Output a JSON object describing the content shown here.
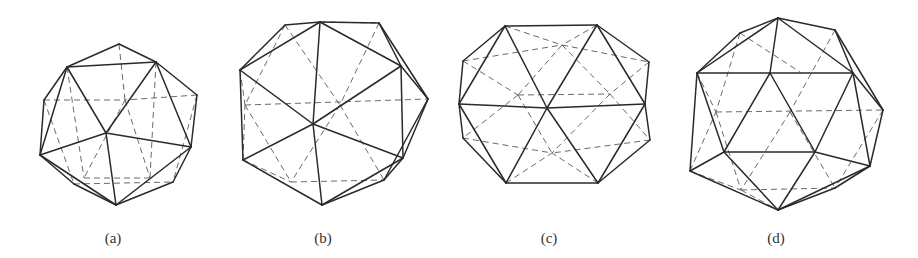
{
  "figure": {
    "colors": {
      "background": "#ffffff",
      "visible_edge": "#2a2a2a",
      "hidden_edge": "#6a6a6a",
      "caption": "#333333"
    },
    "panels": [
      {
        "id": "a",
        "caption": "(a)",
        "caption_x": 113,
        "visible_edges": [
          [
            119,
            44,
            67,
            67
          ],
          [
            119,
            44,
            156,
            62
          ],
          [
            67,
            67,
            156,
            62
          ],
          [
            67,
            67,
            44,
            100
          ],
          [
            156,
            62,
            197,
            95
          ],
          [
            67,
            67,
            106,
            133
          ],
          [
            156,
            62,
            106,
            133
          ],
          [
            44,
            100,
            40,
            155
          ],
          [
            197,
            95,
            191,
            147
          ],
          [
            67,
            67,
            40,
            155
          ],
          [
            156,
            62,
            191,
            147
          ],
          [
            106,
            133,
            40,
            155
          ],
          [
            106,
            133,
            191,
            147
          ],
          [
            106,
            133,
            116,
            205
          ],
          [
            40,
            155,
            74,
            184
          ],
          [
            74,
            184,
            116,
            205
          ],
          [
            40,
            155,
            116,
            205
          ],
          [
            191,
            147,
            173,
            182
          ],
          [
            173,
            182,
            116,
            205
          ],
          [
            191,
            147,
            116,
            205
          ]
        ],
        "hidden_edges": [
          [
            119,
            44,
            125,
            100
          ],
          [
            44,
            100,
            125,
            100
          ],
          [
            197,
            95,
            125,
            100
          ],
          [
            125,
            100,
            150,
            178
          ],
          [
            125,
            100,
            84,
            178
          ],
          [
            74,
            184,
            173,
            182
          ],
          [
            44,
            100,
            74,
            184
          ],
          [
            197,
            95,
            173,
            182
          ],
          [
            84,
            178,
            150,
            178
          ],
          [
            67,
            67,
            84,
            178
          ],
          [
            156,
            62,
            150,
            178
          ]
        ]
      },
      {
        "id": "b",
        "caption": "(b)",
        "caption_x": 323,
        "visible_edges": [
          [
            285,
            25,
            320,
            22
          ],
          [
            320,
            22,
            379,
            23
          ],
          [
            285,
            25,
            240,
            70
          ],
          [
            320,
            22,
            240,
            70
          ],
          [
            320,
            22,
            313,
            124
          ],
          [
            320,
            22,
            401,
            66
          ],
          [
            379,
            23,
            401,
            66
          ],
          [
            379,
            23,
            428,
            99
          ],
          [
            401,
            66,
            428,
            99
          ],
          [
            240,
            70,
            313,
            124
          ],
          [
            401,
            66,
            313,
            124
          ],
          [
            240,
            70,
            243,
            160
          ],
          [
            313,
            124,
            243,
            160
          ],
          [
            313,
            124,
            403,
            158
          ],
          [
            401,
            66,
            403,
            158
          ],
          [
            428,
            99,
            403,
            158
          ],
          [
            243,
            160,
            322,
            205
          ],
          [
            313,
            124,
            322,
            205
          ],
          [
            403,
            158,
            322,
            205
          ],
          [
            403,
            158,
            384,
            180
          ],
          [
            384,
            180,
            322,
            205
          ],
          [
            428,
            99,
            384,
            180
          ]
        ],
        "hidden_edges": [
          [
            245,
            105,
            428,
            99
          ],
          [
            240,
            70,
            245,
            105
          ],
          [
            243,
            160,
            245,
            105
          ],
          [
            285,
            25,
            340,
            105
          ],
          [
            379,
            23,
            340,
            105
          ],
          [
            340,
            105,
            291,
            182
          ],
          [
            340,
            105,
            384,
            180
          ],
          [
            291,
            182,
            384,
            180
          ],
          [
            243,
            160,
            291,
            182
          ],
          [
            245,
            105,
            291,
            182
          ],
          [
            285,
            25,
            245,
            105
          ],
          [
            379,
            23,
            428,
            99
          ],
          [
            320,
            22,
            379,
            23
          ]
        ]
      },
      {
        "id": "c",
        "caption": "(c)",
        "caption_x": 549,
        "visible_edges": [
          [
            505,
            26,
            597,
            25
          ],
          [
            505,
            26,
            463,
            61
          ],
          [
            597,
            25,
            649,
            62
          ],
          [
            505,
            26,
            459,
            104
          ],
          [
            505,
            26,
            547,
            108
          ],
          [
            597,
            25,
            547,
            108
          ],
          [
            597,
            25,
            645,
            104
          ],
          [
            463,
            61,
            459,
            104
          ],
          [
            649,
            62,
            645,
            104
          ],
          [
            459,
            104,
            547,
            108
          ],
          [
            547,
            108,
            645,
            104
          ],
          [
            459,
            104,
            463,
            138
          ],
          [
            645,
            104,
            650,
            140
          ],
          [
            459,
            104,
            506,
            183
          ],
          [
            547,
            108,
            506,
            183
          ],
          [
            547,
            108,
            598,
            183
          ],
          [
            645,
            104,
            598,
            183
          ],
          [
            463,
            138,
            506,
            183
          ],
          [
            650,
            140,
            598,
            183
          ],
          [
            506,
            183,
            598,
            183
          ]
        ],
        "hidden_edges": [
          [
            463,
            61,
            562,
            45
          ],
          [
            562,
            45,
            649,
            62
          ],
          [
            505,
            26,
            562,
            45
          ],
          [
            597,
            25,
            562,
            45
          ],
          [
            463,
            61,
            518,
            95
          ],
          [
            649,
            62,
            610,
            94
          ],
          [
            518,
            95,
            610,
            94
          ],
          [
            562,
            45,
            518,
            95
          ],
          [
            562,
            45,
            610,
            94
          ],
          [
            463,
            138,
            552,
            153
          ],
          [
            650,
            140,
            552,
            153
          ],
          [
            518,
            95,
            552,
            153
          ],
          [
            610,
            94,
            552,
            153
          ],
          [
            506,
            183,
            552,
            153
          ],
          [
            598,
            183,
            552,
            153
          ],
          [
            518,
            95,
            463,
            138
          ],
          [
            610,
            94,
            650,
            140
          ]
        ]
      },
      {
        "id": "d",
        "caption": "(d)",
        "caption_x": 776,
        "visible_edges": [
          [
            778,
            18,
            740,
            33
          ],
          [
            778,
            18,
            835,
            30
          ],
          [
            740,
            33,
            697,
            73
          ],
          [
            778,
            18,
            697,
            73
          ],
          [
            778,
            18,
            770,
            73
          ],
          [
            778,
            18,
            853,
            73
          ],
          [
            835,
            30,
            853,
            73
          ],
          [
            835,
            30,
            883,
            110
          ],
          [
            697,
            73,
            770,
            73
          ],
          [
            770,
            73,
            853,
            73
          ],
          [
            853,
            73,
            883,
            110
          ],
          [
            697,
            73,
            724,
            152
          ],
          [
            770,
            73,
            724,
            152
          ],
          [
            770,
            73,
            815,
            152
          ],
          [
            853,
            73,
            815,
            152
          ],
          [
            853,
            73,
            870,
            166
          ],
          [
            883,
            110,
            870,
            166
          ],
          [
            697,
            73,
            690,
            171
          ],
          [
            724,
            152,
            815,
            152
          ],
          [
            690,
            171,
            724,
            152
          ],
          [
            815,
            152,
            870,
            166
          ],
          [
            690,
            171,
            778,
            210
          ],
          [
            724,
            152,
            778,
            210
          ],
          [
            815,
            152,
            778,
            210
          ],
          [
            870,
            166,
            778,
            210
          ],
          [
            870,
            166,
            835,
            188
          ],
          [
            835,
            188,
            778,
            210
          ]
        ],
        "hidden_edges": [
          [
            716,
            112,
            883,
            110
          ],
          [
            697,
            73,
            716,
            112
          ],
          [
            690,
            171,
            716,
            112
          ],
          [
            740,
            33,
            716,
            112
          ],
          [
            835,
            30,
            790,
            112
          ],
          [
            740,
            33,
            800,
            72
          ],
          [
            716,
            112,
            741,
            190
          ],
          [
            741,
            190,
            835,
            188
          ],
          [
            690,
            171,
            741,
            190
          ],
          [
            790,
            112,
            741,
            190
          ],
          [
            790,
            112,
            835,
            188
          ],
          [
            883,
            110,
            835,
            188
          ],
          [
            741,
            190,
            778,
            210
          ]
        ]
      }
    ]
  }
}
